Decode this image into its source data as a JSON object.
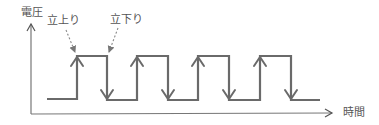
{
  "diagram": {
    "y_axis_label": "電圧",
    "x_axis_label": "時間",
    "annotations": {
      "rising_edge": "立上り",
      "falling_edge": "立下り"
    },
    "colors": {
      "axis": "#777777",
      "signal": "#666666",
      "text": "#555555",
      "dashed_arrow": "#888888"
    },
    "waveform": {
      "type": "square-wave",
      "low_y": 99,
      "high_y": 56,
      "start_x": 47,
      "end_x": 320,
      "rising_edges_x": [
        77,
        137,
        198,
        260
      ],
      "falling_edges_x": [
        107,
        168,
        229,
        291
      ]
    }
  }
}
